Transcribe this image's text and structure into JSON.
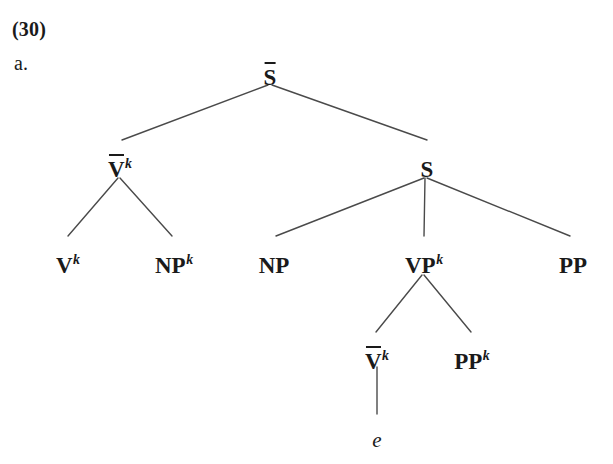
{
  "figure": {
    "example_number": "(30)",
    "sub_label": "a.",
    "line_color": "#4a4a4a",
    "text_color": "#1a1a1a",
    "background": "#ffffff"
  },
  "tree": {
    "nodes": [
      {
        "id": "root",
        "label": "S",
        "overline": true,
        "superscript": "",
        "x": 270,
        "y": 66
      },
      {
        "id": "vbar1",
        "label": "V",
        "overline": true,
        "superscript": "k",
        "x": 120,
        "y": 158
      },
      {
        "id": "s1",
        "label": "S",
        "overline": false,
        "superscript": "",
        "x": 427,
        "y": 158
      },
      {
        "id": "v1",
        "label": "V",
        "overline": false,
        "superscript": "k",
        "x": 68,
        "y": 254
      },
      {
        "id": "np1",
        "label": "NP",
        "overline": false,
        "superscript": "k",
        "x": 174,
        "y": 254
      },
      {
        "id": "np2",
        "label": "NP",
        "overline": false,
        "superscript": "",
        "x": 274,
        "y": 254
      },
      {
        "id": "vp1",
        "label": "VP",
        "overline": false,
        "superscript": "k",
        "x": 424,
        "y": 254
      },
      {
        "id": "pp1",
        "label": "PP",
        "overline": false,
        "superscript": "",
        "x": 573,
        "y": 254
      },
      {
        "id": "vbar2",
        "label": "V",
        "overline": true,
        "superscript": "k",
        "x": 377,
        "y": 350
      },
      {
        "id": "pp2",
        "label": "PP",
        "overline": false,
        "superscript": "k",
        "x": 472,
        "y": 350
      }
    ],
    "trace": {
      "id": "trace-e",
      "label": "e",
      "x": 377,
      "y": 430
    },
    "edges": [
      {
        "from": "root",
        "to": "vbar1",
        "x1": 268,
        "y1": 85,
        "x2": 122,
        "y2": 140
      },
      {
        "from": "root",
        "to": "s1",
        "x1": 272,
        "y1": 85,
        "x2": 427,
        "y2": 140
      },
      {
        "from": "vbar1",
        "to": "v1",
        "x1": 118,
        "y1": 178,
        "x2": 68,
        "y2": 236
      },
      {
        "from": "vbar1",
        "to": "np1",
        "x1": 120,
        "y1": 178,
        "x2": 172,
        "y2": 236
      },
      {
        "from": "s1",
        "to": "np2",
        "x1": 424,
        "y1": 178,
        "x2": 276,
        "y2": 236
      },
      {
        "from": "s1",
        "to": "vp1",
        "x1": 425,
        "y1": 178,
        "x2": 424,
        "y2": 236
      },
      {
        "from": "s1",
        "to": "pp1",
        "x1": 427,
        "y1": 178,
        "x2": 570,
        "y2": 236
      },
      {
        "from": "vp1",
        "to": "vbar2",
        "x1": 422,
        "y1": 275,
        "x2": 376,
        "y2": 332
      },
      {
        "from": "vp1",
        "to": "pp2",
        "x1": 424,
        "y1": 275,
        "x2": 471,
        "y2": 332
      },
      {
        "from": "vbar2",
        "to": "trace",
        "x1": 377,
        "y1": 367,
        "x2": 377,
        "y2": 414
      }
    ]
  }
}
